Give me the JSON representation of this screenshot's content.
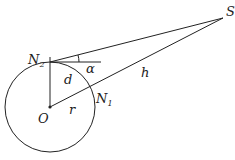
{
  "diagram": {
    "type": "geometry",
    "labels": {
      "S": "S",
      "N2_main": "N",
      "N2_sub": "2",
      "N1_main": "N",
      "N1_sub": "1",
      "alpha": "α",
      "d": "d",
      "h": "h",
      "O": "O",
      "r": "r"
    },
    "points": {
      "O": [
        50,
        107
      ],
      "N2": [
        50,
        62
      ],
      "N1": [
        90,
        86
      ],
      "S": [
        223,
        18
      ]
    },
    "circle": {
      "center": "O",
      "radius": 45
    },
    "colors": {
      "stroke": "#222222",
      "background": "#ffffff"
    }
  }
}
